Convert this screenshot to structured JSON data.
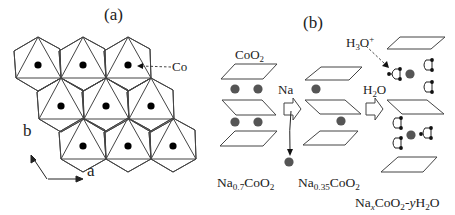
{
  "figure": {
    "panel_a": {
      "label": "(a)",
      "co_label": "Co",
      "axis_a_label": "a",
      "axis_b_label": "b",
      "rows": [
        {
          "row": 1,
          "hexagons": [
            {
              "cx": 38,
              "ty": 37
            },
            {
              "cx": 83,
              "ty": 37
            },
            {
              "cx": 128,
              "ty": 37
            }
          ]
        },
        {
          "row": 2,
          "hexagons": [
            {
              "cx": 61,
              "ty": 78
            },
            {
              "cx": 106,
              "ty": 78
            },
            {
              "cx": 151,
              "ty": 78
            }
          ]
        },
        {
          "row": 3,
          "hexagons": [
            {
              "cx": 83,
              "ty": 118
            },
            {
              "cx": 128,
              "ty": 118
            },
            {
              "cx": 173,
              "ty": 118
            }
          ]
        }
      ]
    },
    "panel_b": {
      "label": "(b)",
      "layer_label": {
        "base": "CoO",
        "sub": "2"
      },
      "step1_arrow_label": "Na",
      "step2_arrow_label": {
        "base": "H",
        "sub": "2",
        "tail": "O"
      },
      "hydronium_label": {
        "base": "H",
        "sub": "3",
        "mid": "O",
        "sup": "+"
      },
      "compounds": [
        {
          "parts": [
            {
              "t": "Na"
            },
            {
              "sub": "0.7"
            },
            {
              "t": "CoO"
            },
            {
              "sub": "2"
            }
          ]
        },
        {
          "parts": [
            {
              "t": "Na"
            },
            {
              "sub": "0.35"
            },
            {
              "t": "CoO"
            },
            {
              "sub": "2"
            }
          ]
        },
        {
          "parts": [
            {
              "t": "Na"
            },
            {
              "sub": "x",
              "italic": true
            },
            {
              "t": "CoO"
            },
            {
              "sub": "2"
            },
            {
              "t": "-"
            },
            {
              "t": "y",
              "italic": true
            },
            {
              "t": "H"
            },
            {
              "sub": "2"
            },
            {
              "t": "O"
            }
          ]
        }
      ]
    },
    "colors": {
      "line": "#444444",
      "co_atom": "#000000",
      "na_atom": "#555555",
      "water_atom": "#111111"
    }
  }
}
